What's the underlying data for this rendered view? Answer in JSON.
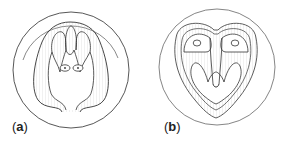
{
  "figure": {
    "panels": [
      {
        "id": "a",
        "label_open": "(",
        "label_letter": "a",
        "label_close": ")"
      },
      {
        "id": "b",
        "label_open": "(",
        "label_letter": "b",
        "label_close": ")"
      }
    ]
  },
  "colors": {
    "line": "#333333",
    "hatch": "#b8b8b8",
    "background": "#ffffff"
  }
}
